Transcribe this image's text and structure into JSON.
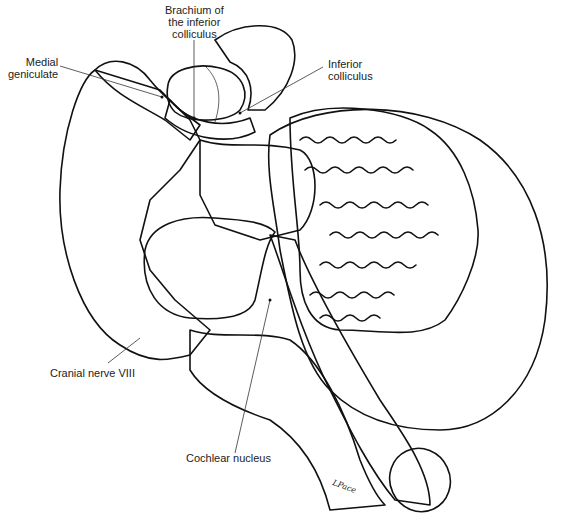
{
  "figure": {
    "labels": {
      "brachium": "Brachium of\nthe inferior\ncolliculus",
      "medial_geniculate": "Medial\ngeniculate",
      "inferior_colliculus": "Inferior\ncolliculus",
      "cranial_nerve": "Cranial nerve VIII",
      "cochlear_nucleus": "Cochlear nucleus"
    },
    "signature": "LPace"
  }
}
